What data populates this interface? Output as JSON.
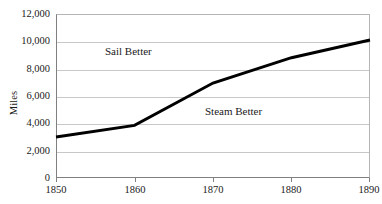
{
  "chart_data": {
    "type": "line",
    "title": "",
    "subtitle": "",
    "xlabel": "",
    "ylabel": "Miles",
    "x": [
      1850,
      1860,
      1870,
      1880,
      1890
    ],
    "series": [
      {
        "name": "Crossover line",
        "values": [
          3000,
          3850,
          6950,
          8800,
          10100
        ]
      }
    ],
    "xlim": [
      1850,
      1890
    ],
    "ylim": [
      0,
      12000
    ],
    "x_ticks": [
      "1850",
      "1860",
      "1870",
      "1880",
      "1890"
    ],
    "y_ticks": [
      "0",
      "2,000",
      "4,000",
      "6,000",
      "8,000",
      "10,000",
      "12,000"
    ],
    "grid": "horizontal",
    "legend": "none",
    "annotations": [
      {
        "text": "Sail Better",
        "region": "above-line"
      },
      {
        "text": "Steam Better",
        "region": "below-line"
      }
    ],
    "line_color": "#000000",
    "grid_color": "#c8c8c8",
    "axis_color": "#808080"
  },
  "axes": {
    "y_title": "Miles",
    "y_tick_labels": [
      "12,000",
      "10,000",
      "8,000",
      "6,000",
      "4,000",
      "2,000",
      "0"
    ],
    "x_tick_labels": [
      "1850",
      "1860",
      "1870",
      "1880",
      "1890"
    ]
  },
  "annotations": {
    "sail": "Sail Better",
    "steam": "Steam Better"
  }
}
